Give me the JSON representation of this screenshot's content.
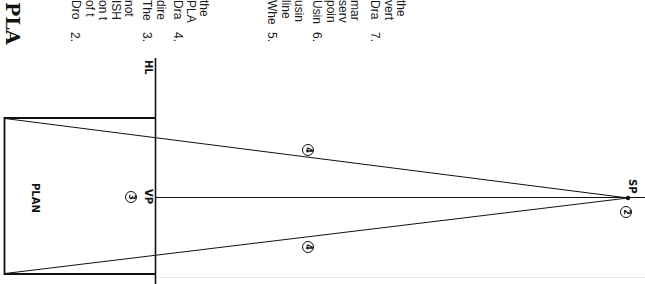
{
  "page": {
    "orientation": "rotated-90-clockwise",
    "title_fragment": "PLA"
  },
  "instructions": [
    {
      "number": "2.",
      "lines": [
        "Dro",
        "of t",
        "on t",
        "ISH",
        "not"
      ]
    },
    {
      "number": "3.",
      "lines": [
        "The",
        "dire"
      ]
    },
    {
      "number": "4.",
      "lines": [
        "Dra",
        "PLA",
        "the"
      ]
    },
    {
      "number": "5.",
      "lines": [
        "Whe",
        "line",
        "usin"
      ]
    },
    {
      "number": "6.",
      "lines": [
        "Usin",
        "poin",
        "serv",
        "mar"
      ]
    },
    {
      "number": "7.",
      "lines": [
        "Dra",
        "vert",
        "the"
      ]
    }
  ],
  "diagram": {
    "plan_label": "PLAN",
    "horizon_label": "HL",
    "vanishing_point_label": "VP",
    "station_point_label": "SP",
    "callouts": {
      "vp_step": "3",
      "sp_step": "2",
      "upper_ray_step": "4",
      "lower_ray_step": "4"
    },
    "line_color": "#111111",
    "background": "#ffffff"
  }
}
